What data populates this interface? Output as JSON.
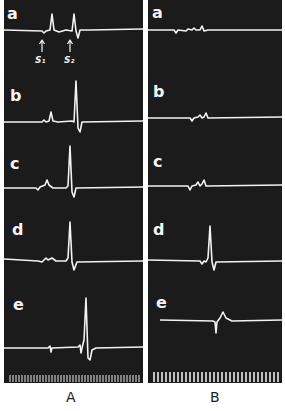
{
  "figure": {
    "panels": [
      {
        "label": "A",
        "rows": [
          {
            "label": "a",
            "annotations": [
              "S₁",
              "S₂"
            ]
          },
          {
            "label": "b"
          },
          {
            "label": "c"
          },
          {
            "label": "d"
          },
          {
            "label": "e"
          }
        ]
      },
      {
        "label": "B",
        "rows": [
          {
            "label": "a"
          },
          {
            "label": "b"
          },
          {
            "label": "c"
          },
          {
            "label": "d"
          },
          {
            "label": "e"
          }
        ]
      }
    ],
    "colors": {
      "background": "#1b1b1b",
      "trace": "#f2f2f2",
      "page": "#ffffff"
    }
  }
}
